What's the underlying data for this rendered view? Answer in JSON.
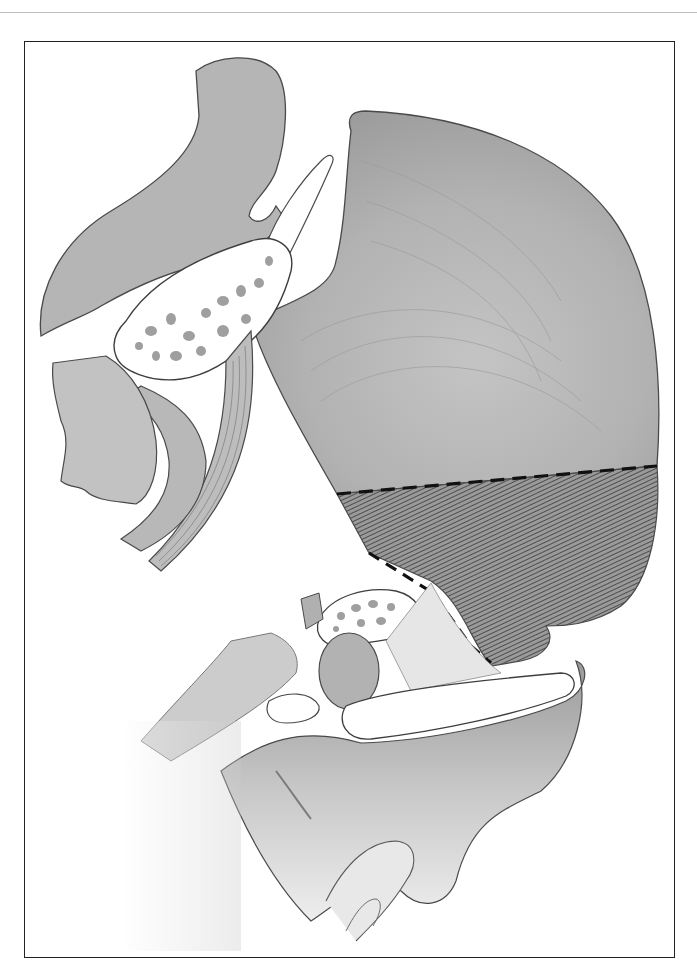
{
  "figure": {
    "type": "anatomical-illustration",
    "colors": {
      "frame": "#222222",
      "tissue_light": "#d6d6d6",
      "tissue_mid": "#b8b8b8",
      "tissue_dark": "#8f8f8f",
      "outline": "#4a4a4a",
      "bone_fill": "#ffffff",
      "hatch": "#3a3a3a",
      "dash": "#111111"
    },
    "regions": [
      {
        "name": "large-fan-muscle"
      },
      {
        "name": "hatched-resection-zone"
      },
      {
        "name": "upper-curved-structure"
      },
      {
        "name": "cancellous-bone-upper"
      },
      {
        "name": "small-bone-sliver"
      },
      {
        "name": "left-soft-tissue"
      },
      {
        "name": "curved-band"
      },
      {
        "name": "striated-band"
      },
      {
        "name": "lower-bone-fragment"
      },
      {
        "name": "oval-nodule"
      },
      {
        "name": "lower-elongated-cavity"
      },
      {
        "name": "lower-base-tissue"
      },
      {
        "name": "bottom-finger-structure"
      }
    ],
    "boundaries": [
      {
        "name": "dashed-horizontal-cut"
      },
      {
        "name": "dashed-oblique-cut"
      }
    ]
  }
}
